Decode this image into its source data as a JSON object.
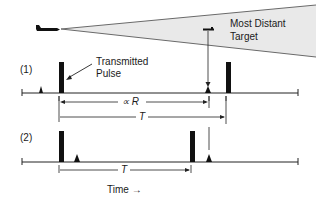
{
  "labels": {
    "most_distant_line1": "Most Distant",
    "most_distant_line2": "Target",
    "transmitted_line1": "Transmitted",
    "transmitted_line2": "Pulse",
    "case1": "(1)",
    "case2": "(2)",
    "range_prop": "∝ R",
    "period1": "T",
    "period2": "T",
    "time_axis": "Time →"
  },
  "colors": {
    "beam_fill": "#e8e8e8",
    "beam_edge": "#666666",
    "ink": "#111111"
  },
  "icons": {
    "aircraft": "aircraft-icon",
    "target": "target-icon"
  }
}
